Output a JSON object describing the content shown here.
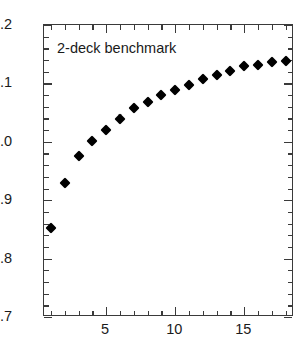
{
  "chart_data": {
    "type": "scatter",
    "title": "",
    "annotation": "2-deck benchmark",
    "xlabel": "",
    "ylabel": "",
    "xlim": [
      0.5,
      18.6
    ],
    "ylim": [
      0.7,
      1.2
    ],
    "grid": false,
    "legend": null,
    "marker": "filled-diamond",
    "marker_color": "#000000",
    "x_ticks_major": [
      5,
      10,
      15
    ],
    "x_tick_labels": [
      "5",
      "10",
      "15"
    ],
    "x_ticks_minor": [
      1,
      2,
      3,
      4,
      6,
      7,
      8,
      9,
      11,
      12,
      13,
      14,
      16,
      17,
      18
    ],
    "y_ticks_major": [
      0.7,
      0.8,
      0.9,
      1.0,
      1.1,
      1.2
    ],
    "y_tick_labels": [
      "0.7",
      "0.8",
      "0.9",
      "1.0",
      "1.1",
      "1.2"
    ],
    "y_ticks_minor": [
      0.72,
      0.74,
      0.76,
      0.78,
      0.82,
      0.84,
      0.86,
      0.88,
      0.92,
      0.94,
      0.96,
      0.98,
      1.02,
      1.04,
      1.06,
      1.08,
      1.12,
      1.14,
      1.16,
      1.18
    ],
    "x": [
      1,
      2,
      3,
      4,
      5,
      6,
      7,
      8,
      9,
      10,
      11,
      12,
      13,
      14,
      15,
      16,
      17,
      18
    ],
    "values": [
      0.853,
      0.93,
      0.975,
      1.002,
      1.021,
      1.039,
      1.058,
      1.069,
      1.08,
      1.089,
      1.098,
      1.107,
      1.114,
      1.122,
      1.129,
      1.132,
      1.136,
      1.139
    ]
  }
}
